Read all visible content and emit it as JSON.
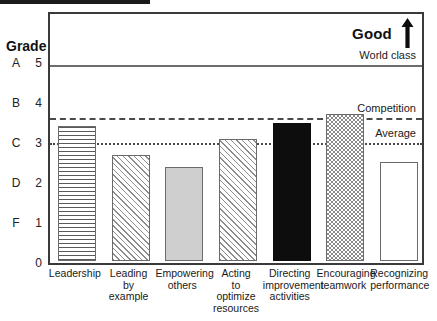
{
  "header": {
    "good_label": "Good",
    "arrow_icon": "up-arrow-icon"
  },
  "axis": {
    "grade_title": "Grade",
    "grades": [
      "A",
      "B",
      "C",
      "D",
      "F"
    ],
    "numbers": [
      "5",
      "4",
      "3",
      "2",
      "1",
      "0"
    ]
  },
  "reference_lines": [
    {
      "label": "World class",
      "value": 5.0,
      "style": "solid"
    },
    {
      "label": "Competition",
      "value": 3.68,
      "style": "dashed"
    },
    {
      "label": "Average",
      "value": 3.05,
      "style": "dotted"
    }
  ],
  "chart_data": {
    "type": "bar",
    "title": "",
    "xlabel": "",
    "ylabel": "Grade",
    "ylim": [
      0,
      5.6
    ],
    "yticks": [
      0,
      1,
      2,
      3,
      4,
      5
    ],
    "ytick_labels": [
      "0",
      "1",
      "2",
      "3",
      "4",
      "5"
    ],
    "grade_scale": {
      "5": "A",
      "4": "B",
      "3": "C",
      "2": "D",
      "1": "F"
    },
    "grid": false,
    "legend": "none",
    "categories": [
      "Leadership",
      "Leading by example",
      "Empowering others",
      "Acting to optimize resources",
      "Directing improvement activities",
      "Encouraging teamwork",
      "Recognizing performance"
    ],
    "values": [
      3.38,
      2.66,
      2.34,
      3.05,
      3.44,
      3.68,
      2.47
    ],
    "fills": [
      "horizontal-lines",
      "diagonal-hatch",
      "solid-light-gray",
      "diagonal-hatch",
      "solid-black",
      "checkerboard",
      "white"
    ],
    "annotations": [
      {
        "text": "Good",
        "position": "top-right"
      },
      {
        "text": "World class",
        "value": 5.0
      },
      {
        "text": "Competition",
        "value": 3.68
      },
      {
        "text": "Average",
        "value": 3.05
      }
    ]
  },
  "xlabels": [
    [
      "Leadership"
    ],
    [
      "Leading",
      "by",
      "example"
    ],
    [
      "Empowering",
      "others"
    ],
    [
      "Acting",
      "to",
      "optimize",
      "resources"
    ],
    [
      "Directing",
      "improvement",
      "activities"
    ],
    [
      "Encouraging",
      "teamwork"
    ],
    [
      "Recognizing",
      "performance"
    ]
  ],
  "colors": {
    "frame": "#3a3a3a",
    "solid_line": "#6d6d6d",
    "dashed_line": "#4a4a4a",
    "bar_outline": "#6a6a6a",
    "black_bar": "#0d0d0d",
    "gray_bar": "#cfcfcf"
  }
}
